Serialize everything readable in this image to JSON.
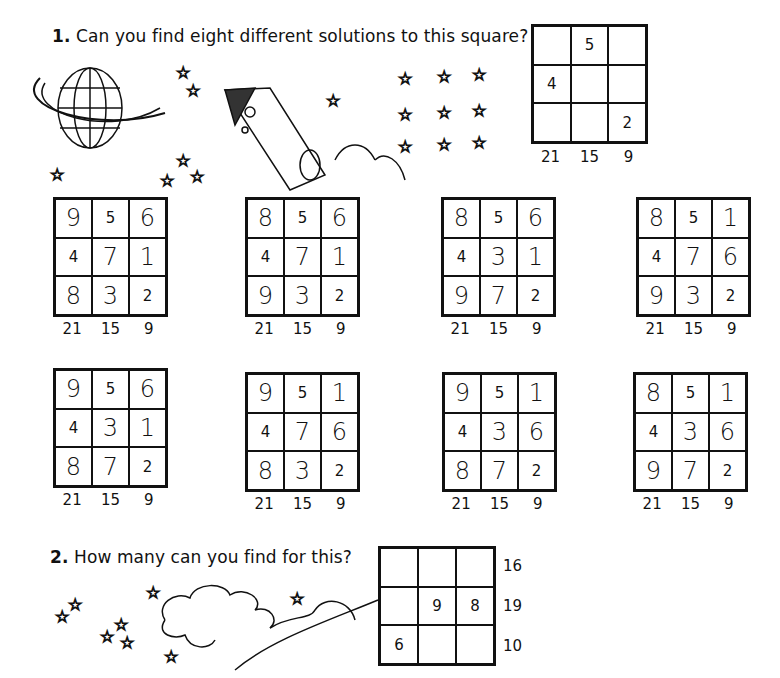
{
  "question1": {
    "number": "1.",
    "text": "Can you find eight different solutions to this square?",
    "puzzle": {
      "cells": [
        "",
        "5",
        "",
        "4",
        "",
        "",
        "",
        "",
        "2"
      ],
      "column_totals": [
        "21",
        "15",
        "9"
      ]
    },
    "solutions": [
      {
        "cells": [
          "9",
          "5",
          "6",
          "4",
          "7",
          "1",
          "8",
          "3",
          "2"
        ],
        "column_totals": [
          "21",
          "15",
          "9"
        ]
      },
      {
        "cells": [
          "8",
          "5",
          "6",
          "4",
          "7",
          "1",
          "9",
          "3",
          "2"
        ],
        "column_totals": [
          "21",
          "15",
          "9"
        ]
      },
      {
        "cells": [
          "8",
          "5",
          "6",
          "4",
          "3",
          "1",
          "9",
          "7",
          "2"
        ],
        "column_totals": [
          "21",
          "15",
          "9"
        ]
      },
      {
        "cells": [
          "8",
          "5",
          "1",
          "4",
          "7",
          "6",
          "9",
          "3",
          "2"
        ],
        "column_totals": [
          "21",
          "15",
          "9"
        ]
      },
      {
        "cells": [
          "9",
          "5",
          "6",
          "4",
          "3",
          "1",
          "8",
          "7",
          "2"
        ],
        "column_totals": [
          "21",
          "15",
          "9"
        ]
      },
      {
        "cells": [
          "9",
          "5",
          "1",
          "4",
          "7",
          "6",
          "8",
          "3",
          "2"
        ],
        "column_totals": [
          "21",
          "15",
          "9"
        ]
      },
      {
        "cells": [
          "9",
          "5",
          "1",
          "4",
          "3",
          "6",
          "8",
          "7",
          "2"
        ],
        "column_totals": [
          "21",
          "15",
          "9"
        ]
      },
      {
        "cells": [
          "8",
          "5",
          "1",
          "4",
          "3",
          "6",
          "9",
          "7",
          "2"
        ],
        "column_totals": [
          "21",
          "15",
          "9"
        ]
      }
    ]
  },
  "question2": {
    "number": "2.",
    "text": "How many can you find for this?",
    "puzzle": {
      "cells": [
        "",
        "",
        "",
        "",
        "9",
        "8",
        "6",
        "",
        ""
      ],
      "row_totals": [
        "16",
        "19",
        "10"
      ]
    }
  },
  "illustrations": [
    "planet-icon",
    "rocket-icon",
    "star-icon",
    "cloud-icon"
  ]
}
